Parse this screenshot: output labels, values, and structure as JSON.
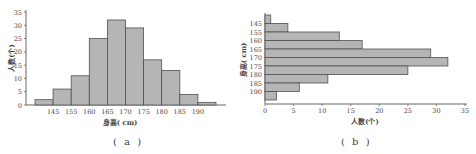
{
  "chart_data": [
    {
      "type": "bar",
      "orientation": "vertical",
      "title": "",
      "caption": "( a )",
      "xlabel": "身高( cm)",
      "ylabel": "人数(个)",
      "x_tick_labels": [
        "145",
        "155",
        "160",
        "165",
        "170",
        "175",
        "180",
        "185",
        "190"
      ],
      "categories": [
        "<145",
        "145-155",
        "155-160",
        "160-165",
        "165-170",
        "170-175",
        "175-180",
        "180-185",
        "185-190",
        ">190"
      ],
      "values": [
        2,
        6,
        11,
        25,
        32,
        29,
        17,
        13,
        4,
        1
      ],
      "y_ticks": [
        0,
        5,
        10,
        15,
        20,
        25,
        30,
        35
      ],
      "ylim": [
        0,
        35
      ],
      "grid": false,
      "bar_color": "#b5b5b5",
      "bar_edge_color": "#505050"
    },
    {
      "type": "bar",
      "orientation": "horizontal",
      "title": "",
      "caption": "( b )",
      "xlabel": "人数(个)",
      "ylabel": "身高( cm)",
      "y_tick_labels": [
        "145",
        "155",
        "160",
        "165",
        "170",
        "175",
        "180",
        "185",
        "190"
      ],
      "categories": [
        "<145",
        "145-155",
        "155-160",
        "160-165",
        "165-170",
        "170-175",
        "175-180",
        "180-185",
        "185-190",
        ">190"
      ],
      "values": [
        1,
        4,
        13,
        17,
        29,
        32,
        25,
        11,
        6,
        2
      ],
      "x_ticks": [
        0,
        5,
        10,
        15,
        20,
        25,
        30,
        35
      ],
      "xlim": [
        0,
        35
      ],
      "grid": false,
      "bar_color": "#b5b5b5",
      "bar_edge_color": "#505050"
    }
  ]
}
